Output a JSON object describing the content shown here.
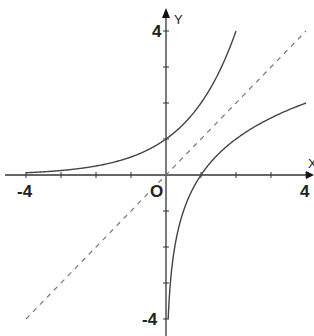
{
  "chart_data": {
    "type": "line",
    "title": "",
    "xlabel": "X",
    "ylabel": "Y",
    "xlim": [
      -4,
      4
    ],
    "ylim": [
      -4,
      4
    ],
    "grid": false,
    "origin_label": "O",
    "x_ticks": [
      -4,
      -3,
      -2,
      -1,
      0,
      1,
      2,
      3,
      4
    ],
    "y_ticks": [
      -4,
      -3,
      -2,
      -1,
      0,
      1,
      2,
      3,
      4
    ],
    "x_tick_labels": [
      {
        "value": -4,
        "text": "-4"
      },
      {
        "value": 4,
        "text": "4"
      }
    ],
    "y_tick_labels": [
      {
        "value": 4,
        "text": "4"
      },
      {
        "value": -4,
        "text": "-4"
      }
    ],
    "series": [
      {
        "name": "exponential",
        "function": "y = 2^x",
        "domain": [
          -4,
          2
        ],
        "style": "solid",
        "sample_points": [
          [
            -4,
            0.0625
          ],
          [
            -2,
            0.25
          ],
          [
            0,
            1
          ],
          [
            1,
            2
          ],
          [
            2,
            4
          ]
        ]
      },
      {
        "name": "logarithm",
        "function": "y = log2(x)",
        "domain": [
          0.0625,
          4
        ],
        "style": "solid",
        "sample_points": [
          [
            0.0625,
            -4
          ],
          [
            0.25,
            -2
          ],
          [
            1,
            0
          ],
          [
            2,
            1
          ],
          [
            4,
            2
          ]
        ]
      },
      {
        "name": "identity",
        "function": "y = x",
        "domain": [
          -4,
          4
        ],
        "style": "dashed",
        "sample_points": [
          [
            -4,
            -4
          ],
          [
            0,
            0
          ],
          [
            4,
            4
          ]
        ]
      }
    ]
  }
}
